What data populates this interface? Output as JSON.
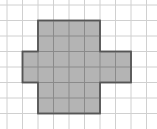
{
  "diagram": {
    "type": "grid-shape",
    "grid": {
      "columns": 10,
      "rows": 8,
      "cell_size": 15.5,
      "origin_x": 7,
      "origin_y": 5,
      "line_color": "#d0d0d0"
    },
    "shape": {
      "name": "plus-cross",
      "fill": "#b4b4b4",
      "stroke": "#555555",
      "outline_cells": [
        [
          3,
          1
        ],
        [
          6,
          1
        ],
        [
          6,
          3
        ],
        [
          8,
          3
        ],
        [
          8,
          5
        ],
        [
          6,
          5
        ],
        [
          6,
          7
        ],
        [
          2,
          7
        ],
        [
          2,
          5
        ],
        [
          1,
          5
        ],
        [
          1,
          3
        ],
        [
          2,
          3
        ],
        [
          2,
          1
        ]
      ],
      "cell_count": 24
    }
  }
}
